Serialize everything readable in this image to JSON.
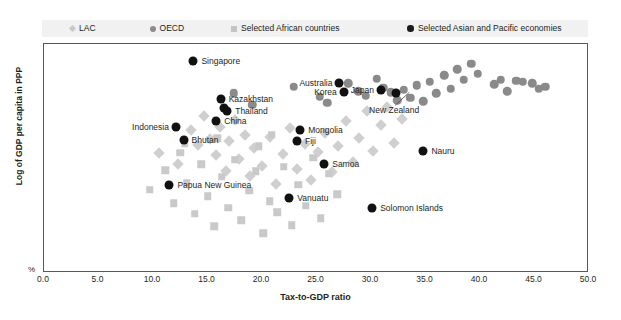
{
  "chart_data": {
    "type": "scatter",
    "title": "",
    "xlabel": "Tax-to-GDP ratio",
    "ylabel": "Log of GDP per capita in PPP",
    "unit_label": "%",
    "xlim": [
      0.0,
      50.0
    ],
    "ylim": [
      0,
      100
    ],
    "xticks": [
      "0.0",
      "5.0",
      "10.0",
      "15.0",
      "20.0",
      "25.0",
      "30.0",
      "35.0",
      "40.0",
      "45.0",
      "50.0"
    ],
    "yticks": [],
    "grid": false,
    "legend_position": "top",
    "colors": {
      "lac": "#cfcfcf",
      "oecd": "#8a8a8a",
      "african": "#c9c9c9",
      "asia_pacific": "#111111",
      "frame": "#58585a",
      "legend_background": "#f1f1f1",
      "text": "#231f20"
    },
    "series": [
      {
        "name": "LAC",
        "marker": "diamond",
        "color": "#cfcfcf",
        "points": [
          {
            "x": 10.6,
            "y": 52.0
          },
          {
            "x": 12.4,
            "y": 47.0
          },
          {
            "x": 13.6,
            "y": 62.0
          },
          {
            "x": 14.2,
            "y": 55.5
          },
          {
            "x": 14.8,
            "y": 68.0
          },
          {
            "x": 15.3,
            "y": 58.0
          },
          {
            "x": 15.9,
            "y": 51.0
          },
          {
            "x": 16.2,
            "y": 63.5
          },
          {
            "x": 16.8,
            "y": 44.0
          },
          {
            "x": 17.1,
            "y": 57.0
          },
          {
            "x": 17.6,
            "y": 66.5
          },
          {
            "x": 18.0,
            "y": 49.5
          },
          {
            "x": 18.5,
            "y": 60.0
          },
          {
            "x": 19.0,
            "y": 42.0
          },
          {
            "x": 19.4,
            "y": 54.0
          },
          {
            "x": 20.1,
            "y": 46.5
          },
          {
            "x": 20.8,
            "y": 59.0
          },
          {
            "x": 21.4,
            "y": 38.5
          },
          {
            "x": 22.0,
            "y": 51.5
          },
          {
            "x": 22.7,
            "y": 63.0
          },
          {
            "x": 23.3,
            "y": 45.0
          },
          {
            "x": 24.0,
            "y": 56.0
          },
          {
            "x": 24.6,
            "y": 40.0
          },
          {
            "x": 25.2,
            "y": 52.5
          },
          {
            "x": 25.9,
            "y": 60.5
          },
          {
            "x": 26.5,
            "y": 43.5
          },
          {
            "x": 27.1,
            "y": 55.0
          },
          {
            "x": 27.8,
            "y": 66.0
          },
          {
            "x": 28.4,
            "y": 48.0
          },
          {
            "x": 29.0,
            "y": 58.5
          },
          {
            "x": 29.7,
            "y": 70.5
          },
          {
            "x": 30.3,
            "y": 53.0
          },
          {
            "x": 31.0,
            "y": 64.0
          },
          {
            "x": 31.6,
            "y": 72.0
          },
          {
            "x": 32.2,
            "y": 56.5
          },
          {
            "x": 32.9,
            "y": 67.0
          }
        ]
      },
      {
        "name": "OECD",
        "marker": "circle",
        "color": "#8a8a8a",
        "points": [
          {
            "x": 17.5,
            "y": 78.0
          },
          {
            "x": 19.2,
            "y": 73.0
          },
          {
            "x": 23.0,
            "y": 81.0
          },
          {
            "x": 25.4,
            "y": 76.5
          },
          {
            "x": 26.1,
            "y": 74.0
          },
          {
            "x": 28.0,
            "y": 82.5
          },
          {
            "x": 28.9,
            "y": 79.0
          },
          {
            "x": 29.6,
            "y": 77.0
          },
          {
            "x": 30.6,
            "y": 84.5
          },
          {
            "x": 31.2,
            "y": 80.5
          },
          {
            "x": 31.9,
            "y": 78.5
          },
          {
            "x": 32.5,
            "y": 75.0
          },
          {
            "x": 33.1,
            "y": 79.5
          },
          {
            "x": 33.7,
            "y": 76.0
          },
          {
            "x": 34.3,
            "y": 81.5
          },
          {
            "x": 34.9,
            "y": 74.5
          },
          {
            "x": 35.5,
            "y": 83.0
          },
          {
            "x": 36.1,
            "y": 78.0
          },
          {
            "x": 36.8,
            "y": 86.0
          },
          {
            "x": 37.4,
            "y": 80.0
          },
          {
            "x": 38.0,
            "y": 88.5
          },
          {
            "x": 38.6,
            "y": 84.0
          },
          {
            "x": 39.3,
            "y": 91.0
          },
          {
            "x": 39.9,
            "y": 86.5
          },
          {
            "x": 41.4,
            "y": 82.0
          },
          {
            "x": 42.0,
            "y": 84.0
          },
          {
            "x": 42.6,
            "y": 79.0
          },
          {
            "x": 43.4,
            "y": 83.5
          },
          {
            "x": 44.0,
            "y": 83.0
          },
          {
            "x": 44.9,
            "y": 82.5
          },
          {
            "x": 45.5,
            "y": 80.0
          },
          {
            "x": 46.1,
            "y": 81.0
          }
        ]
      },
      {
        "name": "Selected African countries",
        "marker": "square",
        "color": "#c9c9c9",
        "points": [
          {
            "x": 9.8,
            "y": 36.0
          },
          {
            "x": 11.2,
            "y": 44.5
          },
          {
            "x": 12.0,
            "y": 30.0
          },
          {
            "x": 12.6,
            "y": 52.0
          },
          {
            "x": 13.2,
            "y": 39.0
          },
          {
            "x": 13.9,
            "y": 25.5
          },
          {
            "x": 14.5,
            "y": 47.0
          },
          {
            "x": 15.1,
            "y": 33.0
          },
          {
            "x": 15.7,
            "y": 20.0
          },
          {
            "x": 16.4,
            "y": 41.5
          },
          {
            "x": 17.0,
            "y": 28.0
          },
          {
            "x": 17.6,
            "y": 49.0
          },
          {
            "x": 18.2,
            "y": 22.5
          },
          {
            "x": 18.9,
            "y": 35.5
          },
          {
            "x": 19.5,
            "y": 44.0
          },
          {
            "x": 20.2,
            "y": 17.0
          },
          {
            "x": 20.8,
            "y": 31.0
          },
          {
            "x": 21.5,
            "y": 26.0
          },
          {
            "x": 22.1,
            "y": 46.0
          },
          {
            "x": 22.8,
            "y": 20.5
          },
          {
            "x": 23.4,
            "y": 38.0
          },
          {
            "x": 24.1,
            "y": 29.0
          },
          {
            "x": 24.8,
            "y": 50.0
          },
          {
            "x": 25.5,
            "y": 23.5
          },
          {
            "x": 26.2,
            "y": 43.0
          },
          {
            "x": 27.0,
            "y": 34.0
          },
          {
            "x": 16.0,
            "y": 58.5
          },
          {
            "x": 13.0,
            "y": 56.0
          },
          {
            "x": 19.8,
            "y": 55.0
          },
          {
            "x": 21.0,
            "y": 60.0
          }
        ]
      },
      {
        "name": "Selected Asian and Pacific economies",
        "marker": "circle",
        "color": "#111111",
        "points": [
          {
            "x": 13.8,
            "y": 92.0,
            "label": "Singapore",
            "label_pos": "right"
          },
          {
            "x": 16.3,
            "y": 75.5,
            "label": "Kazakhstan",
            "label_pos": "right"
          },
          {
            "x": 16.9,
            "y": 70.5,
            "label": "Thailand",
            "label_pos": "right"
          },
          {
            "x": 16.6,
            "y": 71.5,
            "label": "",
            "label_pos": "right"
          },
          {
            "x": 15.9,
            "y": 66.0,
            "label": "China",
            "label_pos": "right"
          },
          {
            "x": 12.2,
            "y": 63.5,
            "label": "Indonesia",
            "label_pos": "left"
          },
          {
            "x": 12.9,
            "y": 57.5,
            "label": "Bhutan",
            "label_pos": "right"
          },
          {
            "x": 11.6,
            "y": 38.0,
            "label": "Papua New Guinea",
            "label_pos": "right"
          },
          {
            "x": 22.6,
            "y": 32.5,
            "label": "Vanuatu",
            "label_pos": "right"
          },
          {
            "x": 23.6,
            "y": 62.0,
            "label": "Mongolia",
            "label_pos": "right"
          },
          {
            "x": 23.3,
            "y": 57.0,
            "label": "Fiji",
            "label_pos": "right"
          },
          {
            "x": 25.8,
            "y": 47.0,
            "label": "Samoa",
            "label_pos": "right"
          },
          {
            "x": 27.2,
            "y": 82.5,
            "label": "Australia",
            "label_pos": "left"
          },
          {
            "x": 27.6,
            "y": 78.5,
            "label": "Korea",
            "label_pos": "left"
          },
          {
            "x": 31.0,
            "y": 79.5,
            "label": "Japan",
            "label_pos": "left"
          },
          {
            "x": 32.4,
            "y": 78.0,
            "label": "New Zealand",
            "label_pos": "below"
          },
          {
            "x": 34.9,
            "y": 53.0,
            "label": "Nauru",
            "label_pos": "right"
          },
          {
            "x": 30.2,
            "y": 28.0,
            "label": "Solomon Islands",
            "label_pos": "right"
          }
        ]
      }
    ]
  },
  "legend": {
    "items": [
      {
        "label": "LAC",
        "marker": "diamond-icon"
      },
      {
        "label": "OECD",
        "marker": "circle-icon"
      },
      {
        "label": "Selected African countries",
        "marker": "square-icon"
      },
      {
        "label": "Selected Asian and Pacific economies",
        "marker": "filled-circle-icon"
      }
    ]
  }
}
